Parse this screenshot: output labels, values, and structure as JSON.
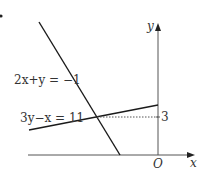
{
  "diagram": {
    "lines": [
      {
        "equation": "2x+y = −1",
        "x1": 39,
        "y1": 22,
        "x2": 120,
        "y2": 155
      },
      {
        "equation": "3y−x = 11",
        "x1": 29,
        "y1": 130,
        "x2": 158,
        "y2": 105
      }
    ],
    "axes": {
      "x_label": "x",
      "y_label": "y",
      "origin_label": "O"
    },
    "intersection_y_label": "3",
    "colors": {
      "line": "#1a1a1a",
      "axis": "#555555",
      "dotted": "#555555"
    }
  }
}
